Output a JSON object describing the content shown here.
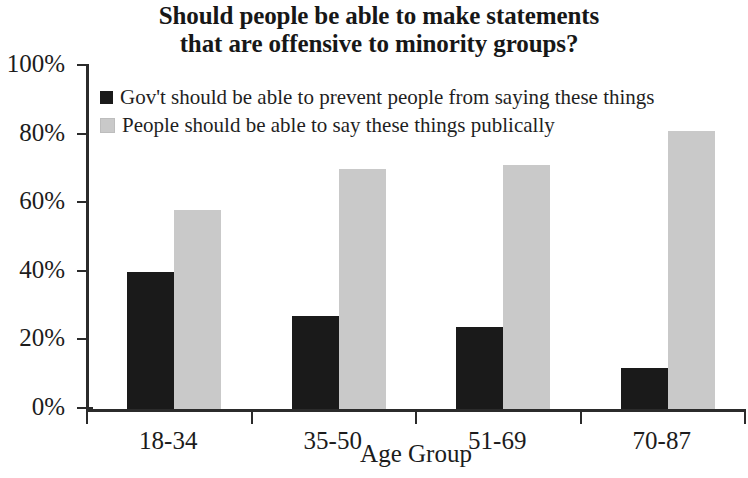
{
  "chart_data": {
    "type": "bar",
    "title": "Should people be able to make statements that are offensive to minority groups?",
    "title_lines": [
      "Should people be able to make statements",
      "that are offensive to minority groups?"
    ],
    "xlabel": "Age Group",
    "ylabel": "",
    "categories": [
      "18-34",
      "35-50",
      "51-69",
      "70-87"
    ],
    "series": [
      {
        "name": "Gov't should be able to prevent people from saying these things",
        "color": "#1a1a1a",
        "values": [
          40,
          27,
          24,
          12
        ]
      },
      {
        "name": "People should be able to say these things publically",
        "color": "#c9c9c9",
        "values": [
          58,
          70,
          71,
          81
        ]
      }
    ],
    "ylim": [
      0,
      100
    ],
    "y_ticks": [
      "0%",
      "20%",
      "40%",
      "60%",
      "80%",
      "100%"
    ],
    "y_tick_values": [
      0,
      20,
      40,
      60,
      80,
      100
    ],
    "value_suffix": "%",
    "grid": false,
    "legend_position": "top-left-inside",
    "orientation": "vertical",
    "grouped": true
  },
  "axes": {
    "y_axis_name": "percent-axis",
    "x_axis_name": "age-group-axis"
  }
}
